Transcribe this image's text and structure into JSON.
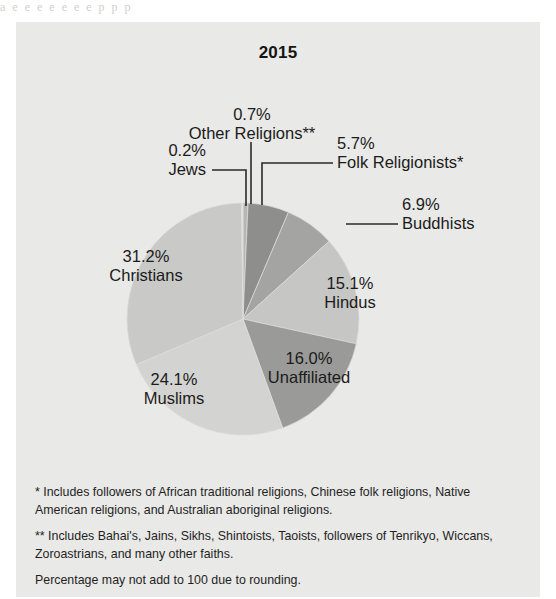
{
  "bleed_text": "a  e  e        e    e    e     e          e      p   p   p",
  "chart_data": {
    "type": "pie",
    "title": "2015",
    "unit": "percent",
    "legend_position": "callout-labels",
    "grid": false,
    "start_angle_deg": 0,
    "direction": "clockwise",
    "categories": [
      "Other Religions**",
      "Folk Religionists*",
      "Buddhists",
      "Hindus",
      "Unaffiliated",
      "Muslims",
      "Christians",
      "Jews"
    ],
    "values": [
      0.7,
      5.7,
      6.9,
      15.1,
      16.0,
      24.1,
      31.2,
      0.2
    ],
    "labels": [
      "0.7%",
      "5.7%",
      "6.9%",
      "15.1%",
      "16.0%",
      "24.1%",
      "31.2%",
      "0.2%"
    ],
    "colors": [
      "#b6b6b4",
      "#8e8e8c",
      "#a4a4a2",
      "#c6c6c4",
      "#9a9a98",
      "#d3d3d1",
      "#c9c9c7",
      "#e4e4e2"
    ],
    "slices": [
      {
        "name": "Other Religions**",
        "value": 0.7,
        "label": "0.7%",
        "color": "#b6b6b4",
        "label_placement": "callout-top"
      },
      {
        "name": "Folk Religionists*",
        "value": 5.7,
        "label": "5.7%",
        "color": "#8e8e8c",
        "label_placement": "callout-upper-right"
      },
      {
        "name": "Buddhists",
        "value": 6.9,
        "label": "6.9%",
        "color": "#a4a4a2",
        "label_placement": "callout-right"
      },
      {
        "name": "Hindus",
        "value": 15.1,
        "label": "15.1%",
        "color": "#c6c6c4",
        "label_placement": "inside"
      },
      {
        "name": "Unaffiliated",
        "value": 16.0,
        "label": "16.0%",
        "color": "#9a9a98",
        "label_placement": "inside"
      },
      {
        "name": "Muslims",
        "value": 24.1,
        "label": "24.1%",
        "color": "#d3d3d1",
        "label_placement": "inside"
      },
      {
        "name": "Christians",
        "value": 31.2,
        "label": "31.2%",
        "color": "#c9c9c7",
        "label_placement": "inside"
      },
      {
        "name": "Jews",
        "value": 0.2,
        "label": "0.2%",
        "color": "#e4e4e2",
        "label_placement": "callout-upper-left"
      }
    ],
    "notes": [
      "* Includes followers of African traditional religions, Chinese folk religions, Native American religions, and Australian aboriginal religions.",
      "** Includes Bahai's, Jains, Sikhs, Shintoists, Taoists, followers of Tenrikyo, Wiccans, Zoroastrians, and many other faiths.",
      "Percentage may not add to 100 due to rounding."
    ]
  },
  "labels": {
    "other_religions": {
      "pct": "0.7%",
      "name": "Other Religions**"
    },
    "jews": {
      "pct": "0.2%",
      "name": "Jews"
    },
    "folk": {
      "pct": "5.7%",
      "name": "Folk Religionists*"
    },
    "buddhists": {
      "pct": "6.9%",
      "name": "Buddhists"
    },
    "hindus": {
      "pct": "15.1%",
      "name": "Hindus"
    },
    "unaffiliated": {
      "pct": "16.0%",
      "name": "Unaffiliated"
    },
    "muslims": {
      "pct": "24.1%",
      "name": "Muslims"
    },
    "christians": {
      "pct": "31.2%",
      "name": "Christians"
    }
  },
  "notes": {
    "note1": "* Includes followers of African traditional religions, Chinese folk religions, Native American religions, and Australian aboriginal religions.",
    "note2": "** Includes Bahai's, Jains, Sikhs, Shintoists, Taoists, followers of Tenrikyo, Wiccans, Zoroastrians, and many other faiths.",
    "note3": "Percentage may not add to 100 due to rounding."
  },
  "colors": {
    "card_background": "#e9e9e7",
    "text": "#1b1b1b",
    "leader_line": "#2a2a2a"
  }
}
